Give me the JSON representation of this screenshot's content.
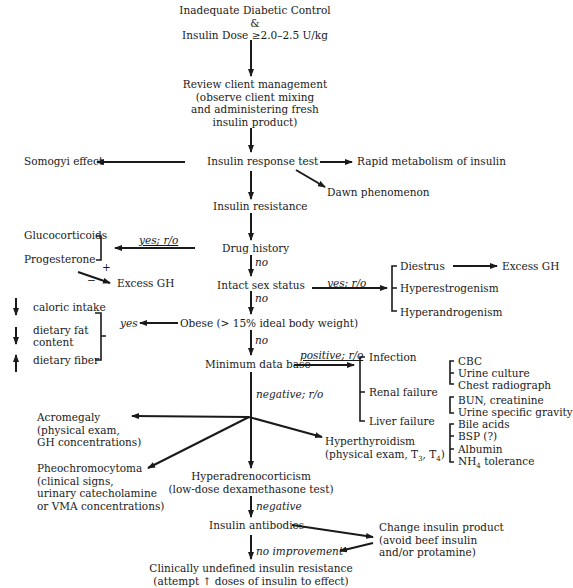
{
  "start": {
    "line1": "Inadequate Diabetic Control",
    "line2": "&",
    "line3": "Insulin Dose ≥2.0–2.5 U/kg"
  },
  "review": {
    "line1": "Review client management",
    "line2": "(observe client mixing",
    "line3": "and administering fresh",
    "line4": "insulin product)"
  },
  "insulin_response_test": "Insulin response test",
  "somogyi": "Somogyi effect",
  "rapid_metabolism": "Rapid metabolism of insulin",
  "dawn": "Dawn phenomenon",
  "insulin_resistance": "Insulin resistance",
  "drug_history": {
    "label": "Drug history",
    "yes_label": "yes; r/o",
    "no_label": "no",
    "glucocorticoids": "Glucocorticoids",
    "progesterone": "Progesterone",
    "plus": "+",
    "minus": "−",
    "excess_gh": "Excess GH"
  },
  "intact_sex": {
    "label": "Intact sex status",
    "yes_label": "yes; r/o",
    "no_label": "no",
    "diestrus": "Diestrus",
    "excess_gh": "Excess GH",
    "hyperestrogenism": "Hyperestrogenism",
    "hyperandrogenism": "Hyperandrogenism"
  },
  "obese": {
    "label": "Obese (> 15% ideal body weight)",
    "yes_label": "yes",
    "no_label": "no",
    "caloric": "caloric intake",
    "fat1": "dietary fat",
    "fat2": "content",
    "fiber": "dietary fiber"
  },
  "mdb": {
    "label": "Minimum data base",
    "positive_label": "positive; r/o",
    "negative_label": "negative; r/o",
    "infection": "Infection",
    "renal": "Renal failure",
    "liver": "Liver failure",
    "infection_tests": [
      "CBC",
      "Urine culture",
      "Chest radiograph"
    ],
    "renal_tests": [
      "BUN, creatinine",
      "Urine specific gravity"
    ],
    "liver_tests": [
      "Bile acids",
      "BSP (?)",
      "Albumin",
      "NH"
    ],
    "nh4_sub": "4",
    "nh4_rest": " tolerance"
  },
  "acromegaly": {
    "line1": "Acromegaly",
    "line2": "(physical exam,",
    "line3": "GH concentrations)"
  },
  "pheo": {
    "line1": "Pheochromocytoma",
    "line2": "(clinical signs,",
    "line3": "urinary catecholamine",
    "line4": "or VMA concentrations)"
  },
  "hyperthyroid": {
    "line1": "Hyperthyroidism",
    "line2a": "(physical exam, T",
    "sub1": "3",
    "line2b": ", T",
    "sub2": "4",
    "line2c": ")"
  },
  "hac": {
    "line1": "Hyperadrenocorticism",
    "line2": "(low-dose dexamethasone test)",
    "negative_label": "negative"
  },
  "antibodies": {
    "label": "Insulin antibodies",
    "no_improvement": "no improvement"
  },
  "change_product": {
    "line1": "Change insulin product",
    "line2": "(avoid beef insulin",
    "line3": "and/or protamine)"
  },
  "undefined": {
    "line1": "Clinically undefined insulin resistance",
    "line2": "(attempt ↑ doses of insulin to effect)"
  },
  "colors": {
    "ink": "#1a1a1a",
    "background": "#ffffff"
  }
}
